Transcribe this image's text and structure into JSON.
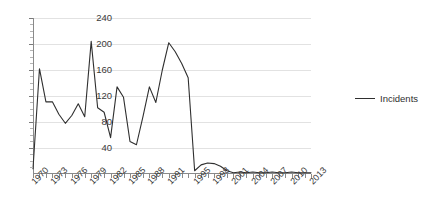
{
  "chart_data": {
    "type": "line",
    "title": "",
    "xlabel": "",
    "ylabel": "",
    "ylim": [
      0,
      240
    ],
    "xlim": [
      1970,
      2013
    ],
    "grid": true,
    "legend_position": "right",
    "y_ticks": [
      240,
      200,
      160,
      120,
      80,
      40
    ],
    "x_tick_labels": [
      "1970",
      "1973",
      "1976",
      "1979",
      "1982",
      "1985",
      "1988",
      "1991",
      "1995",
      "1998",
      "2001",
      "2004",
      "2007",
      "2010",
      "2013"
    ],
    "series": [
      {
        "name": "Incidents",
        "color": "#2f2f2f",
        "x": [
          1970,
          1971,
          1972,
          1973,
          1974,
          1975,
          1976,
          1977,
          1978,
          1979,
          1980,
          1981,
          1982,
          1983,
          1984,
          1985,
          1986,
          1987,
          1988,
          1989,
          1990,
          1991,
          1992,
          1993,
          1994,
          1995,
          1996,
          1997,
          1998,
          1999,
          2000,
          2001,
          2002,
          2003,
          2004,
          2005,
          2006,
          2007,
          2008,
          2009,
          2010,
          2011,
          2012,
          2013
        ],
        "values": [
          8,
          162,
          111,
          111,
          92,
          78,
          90,
          108,
          88,
          204,
          102,
          95,
          56,
          134,
          118,
          50,
          45,
          88,
          134,
          110,
          160,
          202,
          188,
          170,
          148,
          5,
          14,
          17,
          16,
          12,
          5,
          2,
          3,
          2,
          3,
          2,
          2,
          3,
          2,
          2,
          3,
          2,
          2,
          2
        ]
      }
    ]
  },
  "legend": {
    "entries": [
      {
        "label": "Incidents"
      }
    ]
  }
}
